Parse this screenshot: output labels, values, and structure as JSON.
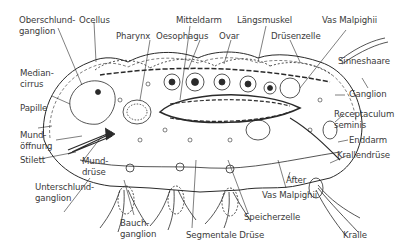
{
  "diagram": {
    "title": "",
    "labels": {
      "oberschlundganglion": [
        "Oberschlund-",
        "ganglion"
      ],
      "ocellus": "Ocellus",
      "pharynx": "Pharynx",
      "mitteldarm": "Mitteldarm",
      "oesophagus": "Oesophagus",
      "ovar": "Ovar",
      "laengsmuskel": "Längsmuskel",
      "druesenzelle": "Drüsenzelle",
      "vas_malpighii_top": "Vas Malpighii",
      "sinneshaare": "Sinneshaare",
      "mediancirrus": [
        "Median-",
        "cirrus"
      ],
      "papille": "Papille",
      "mundoeffnung": [
        "Mund-",
        "öffnung"
      ],
      "stilett": "Stilett",
      "munddruese": [
        "Mund-",
        "drüse"
      ],
      "unterschlundganglion": [
        "Unterschlund-",
        "ganglion"
      ],
      "ganglion": "Ganglion",
      "receptaculum": [
        "Receptaculum",
        "seminis"
      ],
      "enddarm": "Enddarm",
      "krallendruese": "Krallendrüse",
      "after": "After",
      "vas_malpighii_bottom": "Vas Malpighii",
      "bauchganglion": [
        "Bauch-",
        "ganglion"
      ],
      "segmentale_druese": "Segmentale Drüse",
      "speicherzelle": "Speicherzelle",
      "kralle": "Kralle"
    },
    "colors": {
      "line": "#2a2a2a",
      "text": "#3a3a3a",
      "background": "#ffffff"
    }
  }
}
